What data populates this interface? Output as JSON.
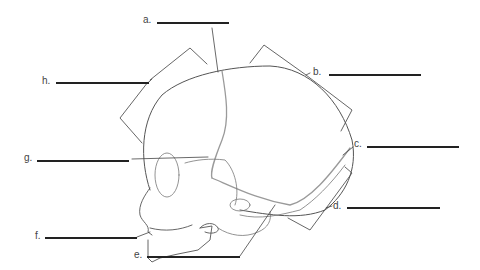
{
  "diagram": {
    "labels": [
      {
        "id": "a",
        "text": "a.",
        "x": 143,
        "y": 15,
        "line_x1": 157,
        "line_x2": 229,
        "line_y": 22
      },
      {
        "id": "b",
        "text": "b.",
        "x": 313,
        "y": 67,
        "line_x1": 329,
        "line_x2": 421,
        "line_y": 74
      },
      {
        "id": "c",
        "text": "c.",
        "x": 354,
        "y": 139,
        "line_x1": 367,
        "line_x2": 459,
        "line_y": 146
      },
      {
        "id": "d",
        "text": "d.",
        "x": 333,
        "y": 201,
        "line_x1": 347,
        "line_x2": 440,
        "line_y": 207
      },
      {
        "id": "e",
        "text": "e.",
        "x": 134,
        "y": 250,
        "line_x1": 147,
        "line_x2": 240,
        "line_y": 256
      },
      {
        "id": "f",
        "text": "f.",
        "x": 35,
        "y": 231,
        "line_x1": 45,
        "line_x2": 137,
        "line_y": 237
      },
      {
        "id": "g",
        "text": "g.",
        "x": 24,
        "y": 153,
        "line_x1": 37,
        "line_x2": 129,
        "line_y": 160
      },
      {
        "id": "h",
        "text": "h.",
        "x": 42,
        "y": 76,
        "line_x1": 56,
        "line_x2": 149,
        "line_y": 82
      }
    ],
    "colors": {
      "outline": "#555555",
      "suture": "#9a9a9a",
      "blank_line": "#222222",
      "label_text": "#444444"
    }
  }
}
